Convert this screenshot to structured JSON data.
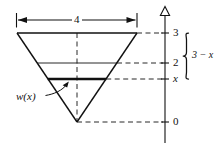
{
  "figure": {
    "stroke_color": "#111111",
    "background_color": "#ffffff",
    "axis": {
      "name": "vertical-axis",
      "arrowhead": "open-triangle-up",
      "ticks": [
        {
          "label": "3",
          "value": 3
        },
        {
          "label": "2",
          "value": 2
        },
        {
          "label": "x",
          "value": 1
        },
        {
          "label": "0",
          "value": 0
        }
      ]
    },
    "dimension": {
      "name": "top-width-dimension",
      "label": "4",
      "value": 4,
      "style": "double-arrow"
    },
    "brace": {
      "name": "depth-brace",
      "label": "3 − x",
      "spans_from": "3",
      "spans_to": "x"
    },
    "callout": {
      "name": "width-function-callout",
      "label": "w(x)",
      "points_to": "bold-chord-at-x"
    },
    "shape": {
      "name": "inverted-triangle",
      "top_left": {
        "x": 17,
        "y": 33
      },
      "top_right": {
        "x": 137,
        "y": 33
      },
      "apex": {
        "x": 77,
        "y": 122
      }
    },
    "chords": [
      {
        "name": "chord-at-2",
        "level": "2",
        "weight": "thin"
      },
      {
        "name": "chord-at-x",
        "level": "x",
        "weight": "bold"
      }
    ],
    "guides": [
      {
        "name": "center-dashed-line",
        "style": "dashed",
        "orientation": "vertical"
      },
      {
        "name": "leader-dash-3",
        "style": "dashed",
        "orientation": "horizontal"
      },
      {
        "name": "leader-dash-2",
        "style": "dashed",
        "orientation": "horizontal"
      },
      {
        "name": "leader-dash-x",
        "style": "dashed",
        "orientation": "horizontal"
      },
      {
        "name": "leader-dash-0",
        "style": "dashed",
        "orientation": "horizontal"
      }
    ]
  }
}
